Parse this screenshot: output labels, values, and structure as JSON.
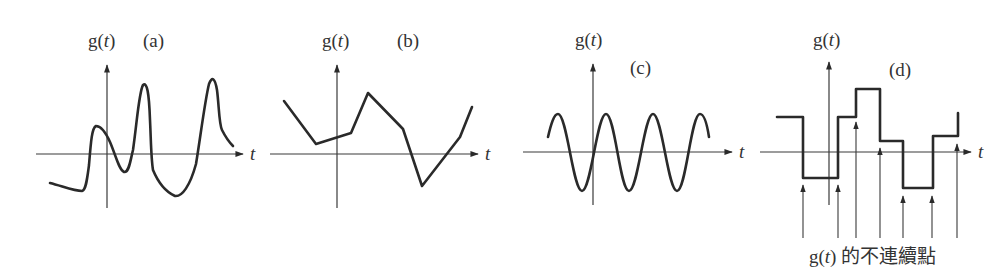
{
  "figure": {
    "colors": {
      "ink": "#2a2a2a",
      "axis": "#3a3a3a",
      "background": "#ffffff"
    },
    "panels": [
      {
        "id": "a",
        "tag": "(a)",
        "y_label": "g(t)",
        "x_label": "t",
        "kind": "smooth-irregular",
        "axis": {
          "x0": 36,
          "x1": 243,
          "y": 154,
          "vx": 107,
          "vtop": 65,
          "vbottom": 208
        },
        "label_pos": {
          "g": [
            88,
            47
          ],
          "tag": [
            143,
            47
          ],
          "t": [
            250,
            160
          ]
        },
        "curve_path": "M50,183 C62,186 74,191 82,191 C86,190 87,180 89,165 C91,140 92,128 96,126 C101,126 106,133 110,142 C116,156 119,170 124,172 C129,173 130,162 133,150 C137,122 139,92 143,85 C147,82 149,92 150,120 C151,140 151,158 153,170 C158,182 166,192 175,196 C182,197 190,186 196,164 C200,140 205,100 209,84 C212,76 215,78 217,90 C219,105 219,124 222,130 C226,138 230,143 233,146"
      },
      {
        "id": "b",
        "tag": "(b)",
        "y_label": "g(t)",
        "x_label": "t",
        "kind": "piecewise-linear",
        "axis": {
          "x0": 270,
          "x1": 478,
          "y": 154,
          "vx": 337,
          "vtop": 65,
          "vbottom": 208
        },
        "label_pos": {
          "g": [
            322,
            47
          ],
          "tag": [
            397,
            47
          ],
          "t": [
            485,
            160
          ]
        },
        "curve_path": "M284,101 L316,144 L351,133 L368,93 L403,129 L422,186 L460,137 L472,107"
      },
      {
        "id": "c",
        "tag": "(c)",
        "y_label": "g(t)",
        "x_label": "t",
        "kind": "sinusoid",
        "axis": {
          "x0": 523,
          "x1": 732,
          "y": 152,
          "vx": 593,
          "vtop": 64,
          "vbottom": 205
        },
        "label_pos": {
          "g": [
            575,
            46
          ],
          "tag": [
            630,
            74
          ],
          "t": [
            739,
            158
          ]
        },
        "curve_path": "M548,137 C551,124 554,114 558,114 C567,114 573,191 582,191 C591,191 597,114 606,114 C615,114 620,191 629,191 C638,191 644,114 653,114 C662,114 668,191 677,191 C686,191 691,114 700,114 C704,114 707,124 709,137"
      },
      {
        "id": "d",
        "tag": "(d)",
        "y_label": "g(t)",
        "x_label": "t",
        "kind": "piecewise-constant",
        "axis": {
          "x0": 760,
          "x1": 971,
          "y": 152,
          "vx": 829,
          "vtop": 62,
          "vbottom": 205
        },
        "label_pos": {
          "g": [
            813,
            46
          ],
          "tag": [
            889,
            76
          ],
          "t": [
            978,
            158
          ]
        },
        "curve_path": "M777,117 L803,117 L803,178 L838,178 L838,117 L856,117 L856,89 L880,89 L880,141 L903,141 L903,188 L933,188 L933,136 L958,136 L958,113",
        "discontinuity_pointers": [
          {
            "x": 803,
            "tip": 185
          },
          {
            "x": 838,
            "tip": 185
          },
          {
            "x": 856,
            "tip": 122
          },
          {
            "x": 880,
            "tip": 148
          },
          {
            "x": 903,
            "tip": 196
          },
          {
            "x": 932,
            "tip": 196
          },
          {
            "x": 957,
            "tip": 144
          }
        ],
        "pointer_bottom": 238,
        "caption": {
          "prefix": "g(",
          "var": "t",
          "suffix": ") 的不連續點",
          "pos": [
            809,
            263
          ]
        }
      }
    ]
  },
  "text": {
    "a": {
      "g_prefix": "g(",
      "g_var": "t",
      "g_suffix": ")",
      "tag": "(a)",
      "t": "t"
    },
    "b": {
      "g_prefix": "g(",
      "g_var": "t",
      "g_suffix": ")",
      "tag": "(b)",
      "t": "t"
    },
    "c": {
      "g_prefix": "g(",
      "g_var": "t",
      "g_suffix": ")",
      "tag": "(c)",
      "t": "t"
    },
    "d": {
      "g_prefix": "g(",
      "g_var": "t",
      "g_suffix": ")",
      "tag": "(d)",
      "t": "t"
    },
    "caption": {
      "prefix": "g(",
      "var": "t",
      "suffix": ") 的不連續點"
    }
  }
}
